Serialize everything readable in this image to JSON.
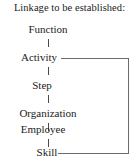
{
  "diagram": {
    "title": "Linkage to be established:",
    "type": "vertical-chain-with-feedback-loop",
    "nodes": [
      {
        "id": "function",
        "label": "Function"
      },
      {
        "id": "activity",
        "label": "Activity"
      },
      {
        "id": "step",
        "label": "Step"
      },
      {
        "id": "organization",
        "label": "Organization"
      },
      {
        "id": "employee",
        "label": "Employee"
      },
      {
        "id": "skill",
        "label": "Skill"
      }
    ],
    "connectors": {
      "chain_ticks": 5,
      "feedback_from": "Activity",
      "feedback_to": "Skill"
    },
    "colors": {
      "background": "#ffffff",
      "text": "#1b1b1b",
      "line": "#6b6b6b",
      "tick": "#4a4a4a"
    }
  }
}
